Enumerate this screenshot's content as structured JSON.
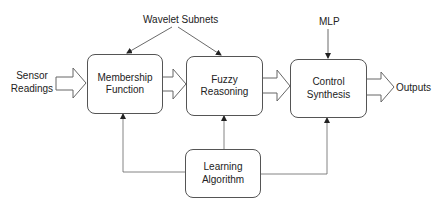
{
  "diagram": {
    "inputs": {
      "sensor_line1": "Sensor",
      "sensor_line2": "Readings"
    },
    "outputs": {
      "label": "Outputs"
    },
    "top_labels": {
      "wavelet": "Wavelet Subnets",
      "mlp": "MLP"
    },
    "blocks": {
      "membership": {
        "line1": "Membership",
        "line2": "Function"
      },
      "fuzzy": {
        "label": "Fuzzy Reasoning"
      },
      "control": {
        "label": "Control Synthesis"
      },
      "learning": {
        "line1": "Learning",
        "line2": "Algorithm"
      }
    },
    "edges": [
      {
        "from": "Sensor Readings",
        "to": "Membership Function",
        "style": "block-arrow"
      },
      {
        "from": "Membership Function",
        "to": "Fuzzy Reasoning",
        "style": "block-arrow"
      },
      {
        "from": "Fuzzy Reasoning",
        "to": "Control Synthesis",
        "style": "block-arrow"
      },
      {
        "from": "Control Synthesis",
        "to": "Outputs",
        "style": "block-arrow"
      },
      {
        "from": "Wavelet Subnets",
        "to": "Membership Function",
        "style": "line-arrow"
      },
      {
        "from": "Wavelet Subnets",
        "to": "Fuzzy Reasoning",
        "style": "line-arrow"
      },
      {
        "from": "MLP",
        "to": "Control Synthesis",
        "style": "line-arrow"
      },
      {
        "from": "Learning Algorithm",
        "to": "Membership Function",
        "style": "line-arrow"
      },
      {
        "from": "Learning Algorithm",
        "to": "Fuzzy Reasoning",
        "style": "line-arrow"
      },
      {
        "from": "Learning Algorithm",
        "to": "Control Synthesis",
        "style": "line-arrow"
      }
    ]
  }
}
